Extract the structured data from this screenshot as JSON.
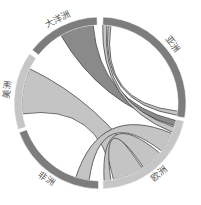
{
  "chart_data": {
    "type": "chord",
    "title": "",
    "center": [
      100,
      103
    ],
    "outer_radius": 86,
    "inner_radius": 78,
    "colors": {
      "dark": "#7d7d7d",
      "light": "#c6c6c6",
      "ribbon_dark": "#8a8a8a",
      "ribbon_light": "#c4c4c4",
      "stroke": "#333333"
    },
    "groups": [
      {
        "name": "亚洲",
        "start": 2,
        "end": 100,
        "shade": "dark"
      },
      {
        "name": "欧洲",
        "start": 102,
        "end": 178,
        "shade": "light"
      },
      {
        "name": "非洲",
        "start": 181,
        "end": 250,
        "shade": "dark"
      },
      {
        "name": "美洲",
        "start": 252,
        "end": 305,
        "shade": "light"
      },
      {
        "name": "大洋洲",
        "start": 308,
        "end": 358,
        "shade": "dark"
      }
    ],
    "ribbons": [
      {
        "source": "美洲",
        "s0": 262,
        "s1": 296,
        "target": "欧洲",
        "t0": 147,
        "t1": 170,
        "shade": "light"
      },
      {
        "source": "大洋洲",
        "s0": 330,
        "s1": 355,
        "target": "欧洲",
        "t0": 103,
        "t1": 107,
        "shade": "dark"
      },
      {
        "source": "亚洲",
        "s0": 2,
        "s1": 5,
        "target": "欧洲",
        "t0": 108,
        "t1": 112,
        "shade": "light"
      },
      {
        "source": "亚洲",
        "s0": 6,
        "s1": 8,
        "target": "亚洲",
        "t0": 96,
        "t1": 99,
        "shade": "light"
      },
      {
        "source": "非洲",
        "s0": 188,
        "s1": 198,
        "target": "欧洲",
        "t0": 113,
        "t1": 128,
        "shade": "light"
      },
      {
        "source": "欧洲",
        "s0": 130,
        "s1": 146,
        "target": "欧洲",
        "t0": 172,
        "t1": 177,
        "shade": "light"
      }
    ]
  }
}
